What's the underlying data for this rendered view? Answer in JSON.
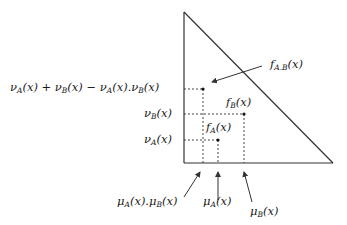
{
  "diagram": {
    "type": "triangle-membership-diagram",
    "colors": {
      "line": "#333333",
      "background": "#ffffff"
    },
    "triangle": {
      "apex": [
        184,
        12
      ],
      "origin": [
        184,
        163
      ],
      "corner": [
        333,
        163
      ]
    },
    "points": [
      {
        "id": "fAB",
        "x": 203,
        "y": 89
      },
      {
        "id": "fB",
        "x": 244,
        "y": 114
      },
      {
        "id": "fA",
        "x": 218,
        "y": 140
      }
    ],
    "labels": {
      "left": {
        "sum": "νA(x) + νB(x) − νA(x).νB(x)",
        "sum_parts": [
          "ν",
          "A",
          "(x) + ν",
          "B",
          "(x) − ν",
          "A",
          "(x).ν",
          "B",
          "(x)"
        ],
        "nuB": [
          "ν",
          "B",
          "(x)"
        ],
        "nuA": [
          "ν",
          "A",
          "(x)"
        ]
      },
      "points": {
        "fAB": [
          "f",
          "A.B",
          "(x)"
        ],
        "fB": [
          "f",
          "B",
          "(x)"
        ],
        "fA": [
          "f",
          "A",
          "(x)"
        ]
      },
      "bottom": {
        "muAmuB": [
          "μ",
          "A",
          "(x).μ",
          "B",
          "(x)"
        ],
        "muA": [
          "μ",
          "A",
          "(x)"
        ],
        "muB": [
          "μ",
          "B",
          "(x)"
        ]
      }
    }
  }
}
